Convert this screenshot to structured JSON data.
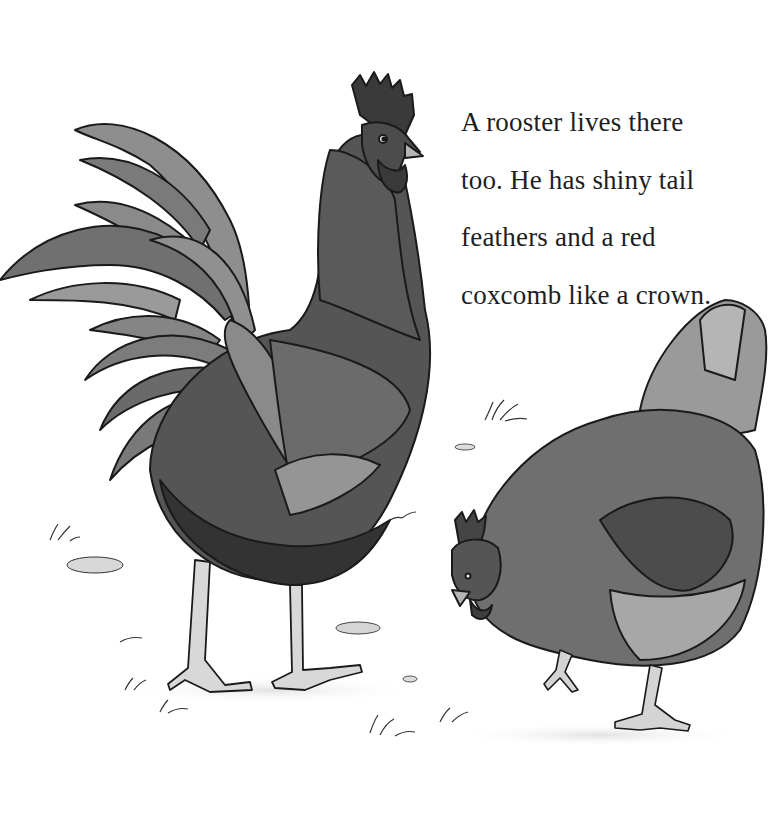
{
  "page": {
    "text_lines": [
      "A rooster lives there",
      "too. He has shiny tail",
      "feathers and a red",
      "coxcomb like a crown."
    ]
  },
  "illustration": {
    "subjects": [
      "rooster",
      "hen"
    ],
    "style": "grayscale watercolor and ink",
    "colors": {
      "background": "#ffffff",
      "ink": "#1a1a1a",
      "dark_feather": "#3c3c3c",
      "mid_feather": "#6e6e6e",
      "light_feather": "#a8a8a8",
      "leg": "#d4d4d4",
      "ground_shadow": "#e6e6e6"
    }
  }
}
